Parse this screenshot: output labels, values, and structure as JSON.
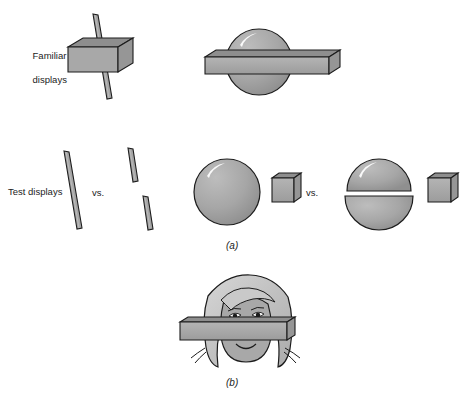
{
  "figure": {
    "background_color": "#ffffff",
    "shape_fill": "#a3a3a3",
    "shape_fill_light": "#b5b5b5",
    "shape_fill_dark": "#8e8e8e",
    "outline_color": "#1c1c1c",
    "highlight_color": "#ffffff"
  },
  "row_labels": {
    "familiar_line1": "Familiar",
    "familiar_line2": "displays",
    "test": "Test displays"
  },
  "comparators": {
    "left_vs": "vs.",
    "right_vs": "vs."
  },
  "panel_labels": {
    "a": "(a)",
    "b": "(b)"
  },
  "objects": {
    "familiar_left": {
      "name": "rod-through-block",
      "parts": [
        "rod",
        "rectangular-block"
      ]
    },
    "familiar_right": {
      "name": "bar-through-sphere",
      "parts": [
        "sphere",
        "horizontal-bar"
      ]
    },
    "test_left_a": {
      "name": "single-whole-rod"
    },
    "test_left_b": {
      "name": "two-rod-segments",
      "count": 2
    },
    "test_right_a": {
      "name": "whole-sphere-and-bar",
      "parts": [
        "sphere",
        "short-bar"
      ]
    },
    "test_right_b": {
      "name": "split-sphere-and-bar",
      "parts": [
        "split-sphere",
        "short-bar"
      ]
    },
    "panel_b_object": {
      "name": "face-behind-bar",
      "parts": [
        "girl-face",
        "horizontal-bar"
      ]
    }
  }
}
